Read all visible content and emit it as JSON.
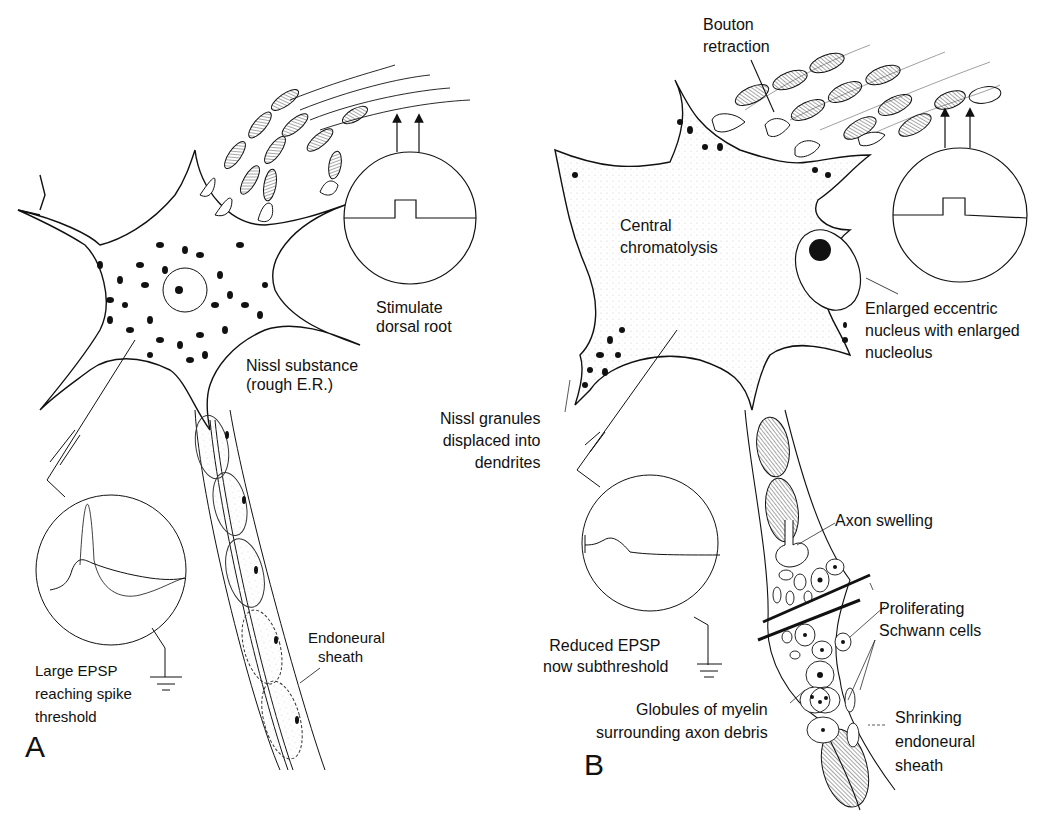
{
  "figure": {
    "panels": [
      {
        "letter": "A",
        "state": "normal neuron",
        "labels": {
          "stimulate": [
            "Stimulate",
            "dorsal root"
          ],
          "nissl": [
            "Nissl substance",
            "(rough E.R.)"
          ],
          "epsp": [
            "Large EPSP",
            "reaching spike",
            "threshold"
          ],
          "sheath": [
            "Endoneural",
            "sheath"
          ]
        }
      },
      {
        "letter": "B",
        "state": "axotomized neuron",
        "labels": {
          "bouton": [
            "Bouton",
            "retraction"
          ],
          "chromatolysis": [
            "Central",
            "chromatolysis"
          ],
          "nucleus": [
            "Enlarged eccentric",
            "nucleus with enlarged",
            "nucleolus"
          ],
          "nissl": [
            "Nissl granules",
            "displaced into",
            "dendrites"
          ],
          "axon": [
            "Axon swelling"
          ],
          "epsp": [
            "Reduced EPSP",
            "now subthreshold"
          ],
          "schwann": [
            "Proliferating",
            "Schwann cells"
          ],
          "myelin": [
            "Globules of myelin",
            "surrounding axon debris"
          ],
          "sheath": [
            "Shrinking",
            "endoneural",
            "sheath"
          ]
        }
      }
    ],
    "colors": {
      "ink": "#111111",
      "paper": "#ffffff",
      "stipple": "#bbbbbb"
    }
  }
}
